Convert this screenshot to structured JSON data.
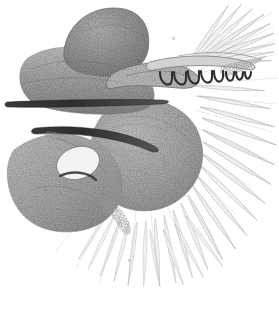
{
  "figure": {
    "medium": "monochrome stipple lithograph",
    "background_color": "#ffffff",
    "ink_color": "#4a4a4a",
    "dark_ink_color": "#2b2b2b",
    "mid_tone_color": "#8d8d8d",
    "light_tone_color": "#c9c9c9",
    "width": 279,
    "height": 317,
    "annotation_mark": "n",
    "annotation_mark_2": "s"
  },
  "parts": {
    "dorsal_lobe": "dorsal rounded lobe",
    "hyomandibular_arch": "curved arch bone",
    "ceratohyal_rod": "upper dark rod",
    "lower_rod": "lower dark rod",
    "gill_arch": "gill arch with rakers",
    "operculum_mass": "large rounded opercular mass",
    "lower_left_mass": "lower left stippled mass",
    "hook_loop": "hooked loop element",
    "ray_fan": "fan of radiating filaments"
  },
  "counts": {
    "rakers": 8,
    "upper_rays": 9,
    "right_rays": 11,
    "lower_rays": 14
  }
}
